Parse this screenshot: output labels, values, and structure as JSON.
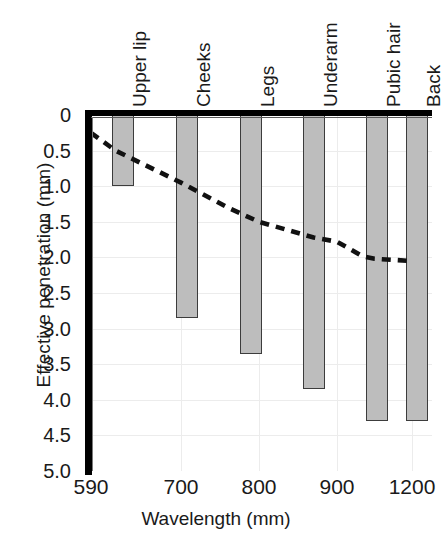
{
  "chart_data": {
    "type": "bar",
    "title": "",
    "subtitle": "",
    "xlabel": "Wavelength (mm)",
    "ylabel": "Effective penetration (mm)",
    "y_axis_inverted": true,
    "ylim": [
      0,
      5.0
    ],
    "y_ticks": [
      "0",
      "0.5",
      "1.0",
      "1.5",
      "2.0",
      "2.5",
      "3.0",
      "3.5",
      "4.0",
      "4.5",
      "5.0"
    ],
    "y_tick_values": [
      0,
      0.5,
      1.0,
      1.5,
      2.0,
      2.5,
      3.0,
      3.5,
      4.0,
      4.5,
      5.0
    ],
    "x_ticks": [
      "590",
      "700",
      "800",
      "900",
      "1200"
    ],
    "x_tick_values": [
      590,
      700,
      800,
      900,
      1200
    ],
    "x_axis_note": "categorical / non-linear spacing",
    "grid": true,
    "legend": "none",
    "categories": [
      "Upper lip",
      "Cheeks",
      "Legs",
      "Underarm",
      "Pubic hair",
      "Back"
    ],
    "values": [
      1.0,
      2.85,
      3.35,
      3.85,
      4.3,
      4.3
    ],
    "bar_color": "#bdbdbd",
    "bar_edge_color": "#3c3c3c",
    "series": [
      {
        "name": "Effective penetration depth",
        "type": "bar",
        "values": [
          1.0,
          2.85,
          3.35,
          3.85,
          4.3,
          4.3
        ]
      },
      {
        "name": "Penetration depth trend",
        "type": "line",
        "style": "dashed",
        "color": "#111111",
        "x": [
          590,
          620,
          700,
          760,
          800,
          870,
          900,
          1000,
          1050,
          1200
        ],
        "values": [
          0.25,
          0.5,
          0.95,
          1.3,
          1.5,
          1.72,
          1.78,
          1.98,
          2.02,
          2.05
        ]
      }
    ]
  },
  "axes": {
    "ylabel": "Effective penetration (mm)",
    "xlabel": "Wavelength (mm)",
    "yticks": [
      "0",
      "0.5",
      "1.0",
      "1.5",
      "2.0",
      "2.5",
      "3.0",
      "3.5",
      "4.0",
      "4.5",
      "5.0"
    ],
    "xticks": [
      "590",
      "700",
      "800",
      "900",
      "1200"
    ]
  },
  "categories": [
    {
      "label": "Upper lip",
      "value": 1.0
    },
    {
      "label": "Cheeks",
      "value": 2.85
    },
    {
      "label": "Legs",
      "value": 3.35
    },
    {
      "label": "Underarm",
      "value": 3.85
    },
    {
      "label": "Pubic hair",
      "value": 4.3
    },
    {
      "label": "Back",
      "value": 4.3
    }
  ]
}
